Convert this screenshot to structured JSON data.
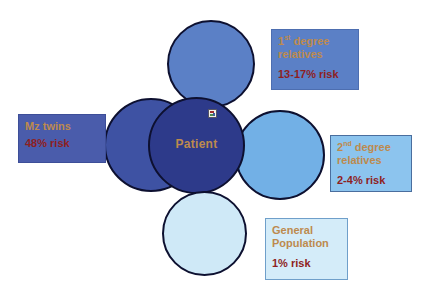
{
  "diagram": {
    "patient": {
      "label": "Patient"
    },
    "circles": {
      "top": {
        "name": "first-degree-relatives-circle",
        "color": "#5b80c6"
      },
      "left": {
        "name": "mz-twins-circle",
        "color": "#3e52a3"
      },
      "right": {
        "name": "second-degree-relatives-circle",
        "color": "#72b0e6"
      },
      "center": {
        "name": "patient-circle",
        "color": "#2d3a8a"
      },
      "bottom": {
        "name": "general-population-circle",
        "color": "#cfe9f7"
      }
    },
    "labels": {
      "first_degree": {
        "num": "1",
        "sup": "st",
        "rest": " degree relatives",
        "risk": "13-17% risk",
        "bg": "#5b80c6"
      },
      "mz_twins": {
        "label": "Mz twins",
        "risk": "48% risk",
        "bg": "#4a5cab"
      },
      "second_degree": {
        "num": "2",
        "sup": "nd",
        "rest": " degree relatives",
        "risk": "2-4% risk",
        "bg": "#8cc4ee"
      },
      "general": {
        "label": "General Population",
        "risk": "1% risk",
        "bg": "#d4ecf9"
      }
    },
    "text_colors": {
      "label": "#bd8a4e",
      "risk": "#8e1f1f",
      "circle_stroke": "#0d1030"
    }
  }
}
